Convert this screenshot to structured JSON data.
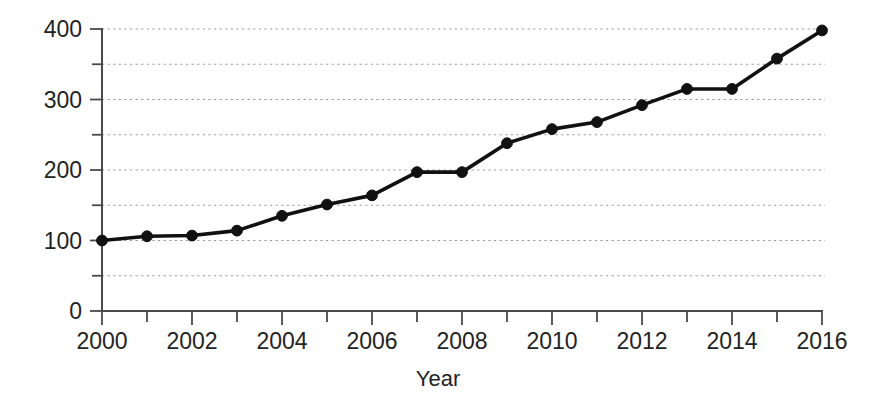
{
  "chart_data": {
    "type": "line",
    "title": "",
    "xlabel": "Year",
    "ylabel": "",
    "x": [
      2000,
      2001,
      2002,
      2003,
      2004,
      2005,
      2006,
      2007,
      2008,
      2009,
      2010,
      2011,
      2012,
      2013,
      2014,
      2015,
      2016
    ],
    "values": [
      100,
      106,
      107,
      114,
      135,
      151,
      164,
      197,
      197,
      238,
      258,
      268,
      292,
      315,
      315,
      358,
      398
    ],
    "series": [
      {
        "name": "series-1",
        "values": [
          100,
          106,
          107,
          114,
          135,
          151,
          164,
          197,
          197,
          238,
          258,
          268,
          292,
          315,
          315,
          358,
          398
        ]
      }
    ],
    "xlim": [
      2000,
      2016
    ],
    "ylim": [
      0,
      400
    ],
    "x_tick_labels": [
      "2000",
      "2002",
      "2004",
      "2006",
      "2008",
      "2010",
      "2012",
      "2014",
      "2016"
    ],
    "x_tick_values": [
      2000,
      2002,
      2004,
      2006,
      2008,
      2010,
      2012,
      2014,
      2016
    ],
    "x_minor_tick_values": [
      2001,
      2003,
      2005,
      2007,
      2009,
      2011,
      2013,
      2015
    ],
    "y_tick_labels": [
      "0",
      "100",
      "200",
      "300",
      "400"
    ],
    "y_tick_values": [
      0,
      100,
      200,
      300,
      400
    ],
    "y_minor_tick_values": [
      50,
      150,
      250,
      350
    ],
    "grid": "horizontal-dotted",
    "grid_values": [
      50,
      100,
      150,
      200,
      250,
      300,
      350,
      400
    ],
    "legend": "none",
    "marker": "filled-circle",
    "line_color": "#111111",
    "marker_color": "#111111",
    "grid_color": "#9a9a9a",
    "axis_color": "#4a4a4a",
    "background_color": "#ffffff"
  },
  "axis": {
    "x_title": "Year"
  }
}
